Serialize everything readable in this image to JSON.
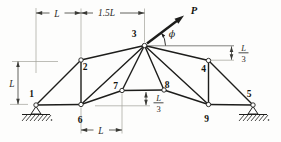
{
  "figure": {
    "colors": {
      "background": "#fdfdfc",
      "line": "#1d1d1b",
      "extension": "#a0a09a",
      "reference": "#62625e",
      "dimension": "#3a3a36"
    },
    "joints": [
      {
        "id": "1",
        "label": "1",
        "x": 36,
        "y": 105,
        "label_pos": [
          31.5,
          96.5
        ]
      },
      {
        "id": "2",
        "label": "2",
        "x": 81,
        "y": 60,
        "label_pos": [
          85,
          69.5
        ]
      },
      {
        "id": "3",
        "label": "3",
        "x": 144.5,
        "y": 45.5,
        "label_pos": [
          134,
          36.5
        ]
      },
      {
        "id": "4",
        "label": "4",
        "x": 208.5,
        "y": 60.5,
        "label_pos": [
          203.5,
          71.5
        ]
      },
      {
        "id": "5",
        "label": "5",
        "x": 253,
        "y": 105,
        "label_pos": [
          249,
          96.5
        ]
      },
      {
        "id": "6",
        "label": "6",
        "x": 81,
        "y": 104.5,
        "label_pos": [
          80,
          123
        ]
      },
      {
        "id": "7",
        "label": "7",
        "x": 122,
        "y": 90.5,
        "label_pos": [
          115.5,
          88.5
        ]
      },
      {
        "id": "8",
        "label": "8",
        "x": 164,
        "y": 90,
        "label_pos": [
          167,
          88
        ]
      },
      {
        "id": "9",
        "label": "9",
        "x": 208.5,
        "y": 104.5,
        "label_pos": [
          206.5,
          121.5
        ]
      }
    ],
    "members": [
      [
        "1",
        "2"
      ],
      [
        "1",
        "6"
      ],
      [
        "2",
        "3"
      ],
      [
        "2",
        "6"
      ],
      [
        "3",
        "4"
      ],
      [
        "3",
        "6"
      ],
      [
        "3",
        "7"
      ],
      [
        "3",
        "8"
      ],
      [
        "3",
        "9"
      ],
      [
        "4",
        "5"
      ],
      [
        "4",
        "9"
      ],
      [
        "6",
        "7"
      ],
      [
        "7",
        "8"
      ],
      [
        "8",
        "9"
      ],
      [
        "9",
        "5"
      ]
    ],
    "supports": [
      {
        "joint": "1",
        "type": "pin"
      },
      {
        "joint": "5",
        "type": "pin"
      }
    ],
    "extension_lines": [
      {
        "x1": 36,
        "y1": 8,
        "x2": 36,
        "y2": 73
      },
      {
        "x1": 81,
        "y1": 8.5,
        "x2": 81,
        "y2": 56.5
      },
      {
        "x1": 144.5,
        "y1": 8.5,
        "x2": 144.5,
        "y2": 42
      },
      {
        "x1": 12,
        "y1": 61.5,
        "x2": 58,
        "y2": 61.5
      },
      {
        "x1": 10,
        "y1": 104.4,
        "x2": 28,
        "y2": 104.4
      },
      {
        "x1": 81,
        "y1": 107.5,
        "x2": 81,
        "y2": 133.5
      },
      {
        "x1": 122,
        "y1": 93.5,
        "x2": 122,
        "y2": 133.5
      },
      {
        "x1": 95,
        "y1": 105.8,
        "x2": 150,
        "y2": 105.8
      },
      {
        "x1": 211,
        "y1": 60.2,
        "x2": 234,
        "y2": 60.2
      },
      {
        "x1": 148.5,
        "y1": 45.8,
        "x2": 234,
        "y2": 45.8,
        "dark": true
      }
    ],
    "dimensions": [
      {
        "id": "span-1-2",
        "orient": "h",
        "label": "L",
        "y": 13,
        "from": 36,
        "to": 81,
        "gap": [
          49.5,
          64.5
        ],
        "label_pos": [
          57,
          16.5
        ]
      },
      {
        "id": "span-2-3",
        "orient": "h",
        "label": "1.5L",
        "y": 13,
        "from": 81,
        "to": 144.5,
        "gap": [
          93,
          120
        ],
        "label_pos": [
          106.5,
          16
        ]
      },
      {
        "id": "height-L",
        "orient": "v",
        "label": "L",
        "x": 18,
        "from": 61.5,
        "to": 104.2,
        "label_pos": [
          12,
          87
        ]
      },
      {
        "id": "span-6-7",
        "orient": "h",
        "label": "L",
        "y": 130,
        "from": 81,
        "to": 122,
        "gap": [
          93.5,
          109
        ],
        "label_pos": [
          101,
          133.5
        ]
      },
      {
        "id": "depth-7-8",
        "orient": "v",
        "label": "L/3",
        "x": 146,
        "from": 92,
        "to": 105.2,
        "fraction": {
          "num": "L",
          "den": "3"
        },
        "num_pos": [
          158.5,
          100.5
        ],
        "bar": [
          153.5,
          102.8,
          163.5
        ],
        "den_pos": [
          158.5,
          112
        ]
      },
      {
        "id": "drop-3-4",
        "orient": "v",
        "label": "L/3",
        "x": 231.5,
        "from": 46.4,
        "to": 59.7,
        "fraction": {
          "num": "L",
          "den": "3"
        },
        "num_pos": [
          243.5,
          50.5
        ],
        "bar": [
          238.5,
          52.8,
          248.5
        ],
        "den_pos": [
          243.5,
          62
        ]
      }
    ],
    "load": {
      "label": "P",
      "angle_label": "ϕ",
      "tail": [
        147,
        43.5
      ],
      "tip": [
        184,
        15.5
      ],
      "label_pos": [
        194,
        13.5
      ],
      "angle_label_pos": [
        172,
        36.5
      ],
      "arc_path": "M 165.5 45.5 A 21 21 0 0 0 161.3 32.9",
      "arc_tip": [
        161.3,
        32.9
      ],
      "arc_tip_dir": [
        -0.6,
        -0.8
      ]
    }
  }
}
